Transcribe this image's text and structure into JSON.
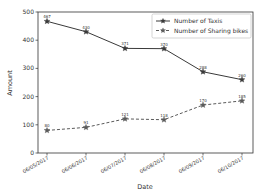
{
  "chart_data": {
    "type": "line",
    "title": "",
    "xlabel": "Date",
    "ylabel": "Amount",
    "ylim": [
      0,
      500
    ],
    "yticks": [
      0,
      100,
      200,
      300,
      400,
      500
    ],
    "grid": false,
    "legend_position": "upper right",
    "categories": [
      "06/05/2017",
      "06/06/2017",
      "06/07/2017",
      "06/08/2017",
      "06/09/2017",
      "06/10/2017"
    ],
    "series": [
      {
        "name": "Number of Taxis",
        "values": [
          467,
          430,
          371,
          370,
          288,
          260
        ],
        "line_style": "solid",
        "marker": "star",
        "color": "#3a3a3a"
      },
      {
        "name": "Number of Sharing bikes",
        "values": [
          80,
          91,
          121,
          118,
          170,
          185
        ],
        "line_style": "dashed",
        "marker": "star",
        "color": "#5a5a5a"
      }
    ]
  }
}
